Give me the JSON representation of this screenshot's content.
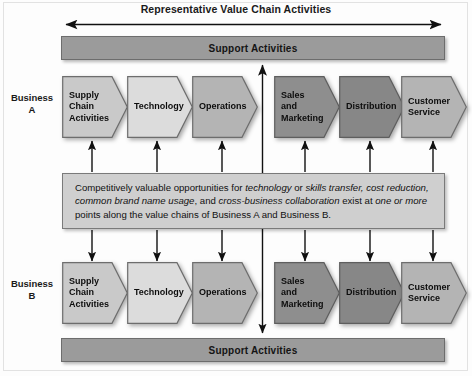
{
  "title": "Representative Value Chain Activities",
  "top_arrow": {
    "name": "representative-value-chain-span-arrow",
    "direction": "double-horizontal"
  },
  "support_top": {
    "label": "Support Activities"
  },
  "support_bottom": {
    "label": "Support Activities"
  },
  "business_a": {
    "label": "Business\nA"
  },
  "business_b": {
    "label": "Business\nB"
  },
  "colors": {
    "support_bar": "#9b9b9b",
    "center_box": "#cfcfcf",
    "border": "#6d6d6d",
    "shade_lightest": "#dcdcdc",
    "shade_light": "#c9c9c9",
    "shade_mid": "#b4b4b4",
    "shade_dark": "#8e8e8e",
    "shade_darker": "#878787"
  },
  "chain_a": [
    {
      "label": "Supply\nChain\nActivities",
      "fill": "#c9c9c9"
    },
    {
      "label": "Technology",
      "fill": "#dcdcdc"
    },
    {
      "label": "Operations",
      "fill": "#b4b4b4"
    },
    {
      "label": "Sales\nand\nMarketing",
      "fill": "#8e8e8e"
    },
    {
      "label": "Distribution",
      "fill": "#878787"
    },
    {
      "label": "Customer\nService",
      "fill": "#b4b4b4"
    }
  ],
  "chain_b": [
    {
      "label": "Supply\nChain\nActivities",
      "fill": "#c9c9c9"
    },
    {
      "label": "Technology",
      "fill": "#dcdcdc"
    },
    {
      "label": "Operations",
      "fill": "#b4b4b4"
    },
    {
      "label": "Sales\nand\nMarketing",
      "fill": "#8e8e8e"
    },
    {
      "label": "Distribution",
      "fill": "#878787"
    },
    {
      "label": "Customer\nService",
      "fill": "#b4b4b4"
    }
  ],
  "center_text": {
    "line1_a": "Competitively valuable opportunities for ",
    "line1_i1": "technology",
    "line1_b": " or ",
    "line1_i2": "skills transfer, cost reduction, common brand name usage",
    "line1_c": ", and ",
    "line1_i3": "cross-business collaboration",
    "line1_d": " exist at ",
    "line1_i4": "one or more",
    "line1_e": " points along the value chains of Business A and Business B.",
    "full": "Competitively valuable opportunities for technology or skills transfer, cost reduction, common brand name usage, and cross-business collaboration exist at one or more points along the value chains of Business A and Business B."
  },
  "connector_arrows": {
    "up_count": 6,
    "down_count": 6,
    "vertical_double_arrow": "support-to-support-link"
  }
}
